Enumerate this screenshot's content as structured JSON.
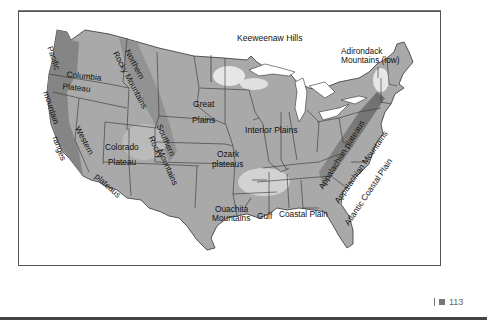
{
  "figure": {
    "labels": {
      "pacific_mountain_ranges_1": "Pacific",
      "pacific_mountain_ranges_2": "mountain",
      "pacific_mountain_ranges_3": "ranges",
      "columbia_plateau_1": "Columbia",
      "columbia_plateau_2": "Plateau",
      "northern_rocky_1": "Northern",
      "northern_rocky_2": "Rocky Mountains",
      "western_plateaus_1": "Western",
      "western_plateaus_2": "plateaus",
      "colorado_plateau_1": "Colorado",
      "colorado_plateau_2": "Plateau",
      "southern_rocky_1": "Southern",
      "southern_rocky_2": "Rocky",
      "southern_rocky_3": "Mountains",
      "great_plains_1": "Great",
      "great_plains_2": "Plains",
      "interior_plains": "Interior Plains",
      "ozark_plateaus_1": "Ozark",
      "ozark_plateaus_2": "plateaus",
      "ouachita_mountains_1": "Ouachita",
      "ouachita_mountains_2": "Mountains",
      "gulf_coastal_plain_1": "Gulf",
      "gulf_coastal_plain_2": "Coastal Plain",
      "keeweenaw_hills": "Keeweenaw Hills",
      "adirondack_1": "Adirondack",
      "adirondack_2": "Mountains (low)",
      "appalachian_plateaus": "Appalachian plateaus",
      "appalachian_mountains": "Appalachian Mountains",
      "atlantic_coastal_plain": "Atlantic Coastal Plain"
    }
  },
  "page": {
    "number": "113"
  },
  "colors": {
    "land": "#a8a8a8",
    "mountains_dark": "#7c7c7c",
    "highlight": "#e4e4e4",
    "water": "#ffffff",
    "border": "#333333"
  }
}
